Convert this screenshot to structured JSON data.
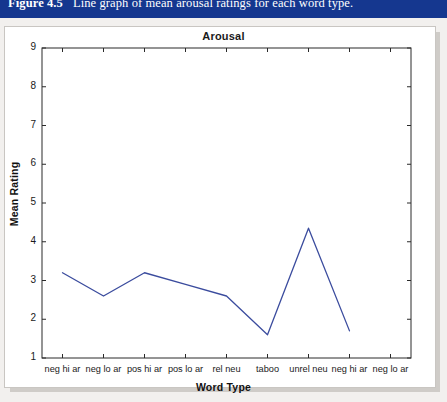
{
  "caption": {
    "label": "Figure 4.5",
    "text": "Line graph of mean arousal ratings for each word type.",
    "bar_color": "#15378f"
  },
  "figure": {
    "panel_background": "#ffffff",
    "page_background": "#f2f0ee"
  },
  "chart_data": {
    "type": "line",
    "title": "Arousal",
    "xlabel": "Word Type",
    "ylabel": "Mean Rating",
    "categories": [
      "neg hi ar",
      "neg lo ar",
      "pos hi ar",
      "pos lo ar",
      "rel neu",
      "taboo",
      "unrel neu",
      "neg hi ar",
      "neg lo ar"
    ],
    "values": [
      3.2,
      2.6,
      3.2,
      2.9,
      2.6,
      1.6,
      4.35,
      1.7,
      null
    ],
    "series": [
      {
        "name": "Mean Arousal Rating",
        "values": [
          3.2,
          2.6,
          3.2,
          2.9,
          2.6,
          1.6,
          4.35,
          1.7,
          null
        ],
        "color": "#3b4c9e"
      }
    ],
    "ylim": [
      1,
      9
    ],
    "yticks": [
      1,
      2,
      3,
      4,
      5,
      6,
      7,
      8,
      9
    ],
    "ytick_labels": [
      "1",
      "2",
      "3",
      "4",
      "5",
      "6",
      "7",
      "8",
      "9"
    ],
    "grid": false,
    "legend": "none",
    "line_color": "#3b4c9e",
    "axis_color": "#2a2a2a"
  }
}
